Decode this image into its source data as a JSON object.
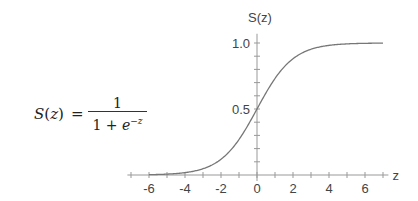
{
  "formula": {
    "lhs_fn": "S",
    "lhs_arg": "z",
    "equals": "=",
    "numerator": "1",
    "denominator_prefix": "1 + ",
    "denominator_base": "e",
    "denominator_exponent": "−z"
  },
  "chart_data": {
    "type": "line",
    "title": "",
    "xlabel": "z",
    "ylabel": "S(z)",
    "function": "S(z) = 1 / (1 + e^-z)",
    "xlim": [
      -7.2,
      7.3
    ],
    "ylim": [
      0,
      1.0
    ],
    "x_ticks": [
      -6,
      -4,
      -2,
      0,
      2,
      4,
      6
    ],
    "x_tick_labels": [
      "-6",
      "-4",
      "-2",
      "0",
      "2",
      "4",
      "6"
    ],
    "x_minor_tick_step": 1,
    "y_ticks": [
      0.5,
      1.0
    ],
    "y_tick_labels": [
      "0.5",
      "1.0"
    ],
    "y_minor_tick_step": 0.1,
    "grid": false,
    "legend": null,
    "series": [
      {
        "name": "S(z)",
        "x": [
          -6,
          -5,
          -4,
          -3,
          -2,
          -1,
          0,
          1,
          2,
          3,
          4,
          5,
          6,
          7
        ],
        "values": [
          0.002,
          0.007,
          0.018,
          0.047,
          0.119,
          0.269,
          0.5,
          0.731,
          0.881,
          0.953,
          0.982,
          0.993,
          0.998,
          0.999
        ]
      }
    ],
    "colors": {
      "curve": "#777777",
      "axis": "#999999",
      "text": "#444444"
    }
  }
}
